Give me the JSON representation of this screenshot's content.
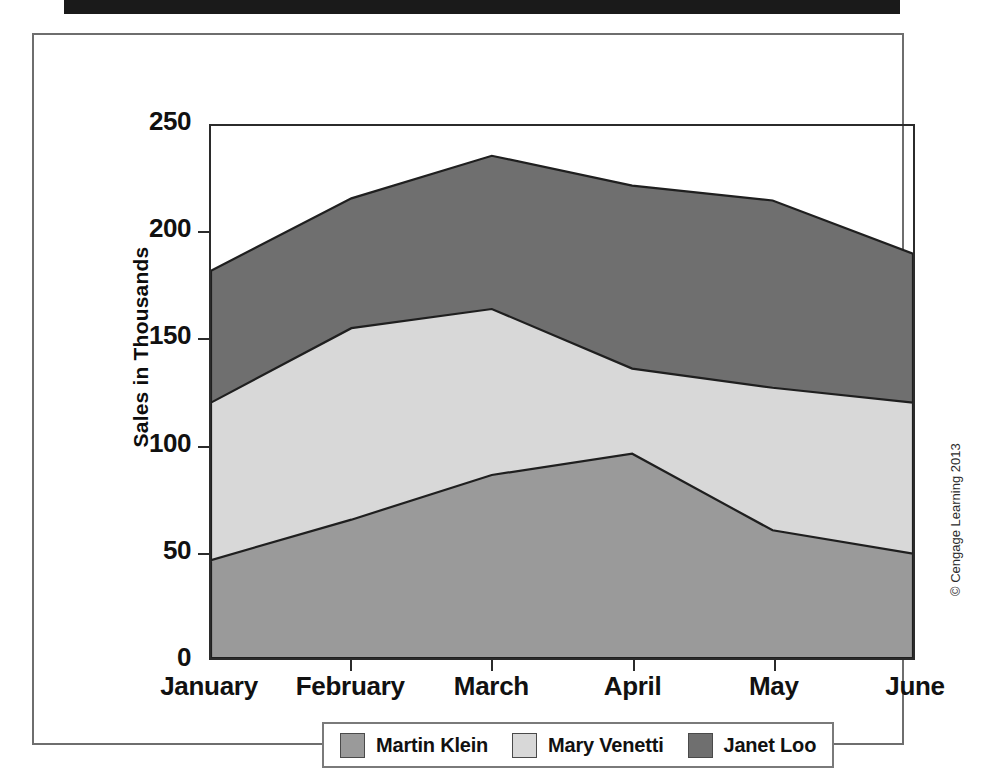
{
  "chart_data": {
    "type": "area",
    "stacked": true,
    "title": "",
    "subtitle": "",
    "xlabel": "",
    "ylabel": "Sales in Thousands",
    "categories": [
      "January",
      "February",
      "March",
      "April",
      "May",
      "June"
    ],
    "ylim": [
      0,
      250
    ],
    "yticks": [
      0,
      50,
      100,
      150,
      200,
      250
    ],
    "ytick_labels": [
      "0",
      "50",
      "100",
      "150",
      "200",
      "250"
    ],
    "grid": false,
    "legend_position": "bottom",
    "series": [
      {
        "name": "Martin Klein",
        "color": "#9a9a9a",
        "values": [
          46,
          65,
          86,
          96,
          60,
          49
        ],
        "cumulative": [
          46,
          65,
          86,
          96,
          60,
          49
        ]
      },
      {
        "name": "Mary Venetti",
        "color": "#d8d8d8",
        "values": [
          74,
          90,
          78,
          40,
          67,
          71
        ],
        "cumulative": [
          120,
          155,
          164,
          136,
          127,
          120
        ]
      },
      {
        "name": "Janet Loo",
        "color": "#6f6f6f",
        "values": [
          62,
          61,
          72,
          86,
          88,
          70
        ],
        "cumulative": [
          182,
          216,
          236,
          222,
          215,
          190
        ]
      }
    ]
  },
  "legend": {
    "items": [
      {
        "label": "Martin Klein",
        "color": "#9a9a9a"
      },
      {
        "label": "Mary Venetti",
        "color": "#d8d8d8"
      },
      {
        "label": "Janet Loo",
        "color": "#6f6f6f"
      }
    ]
  },
  "axis": {
    "y_title": "Sales in Thousands"
  },
  "footer": {
    "copyright": "© Cengage Learning 2013"
  }
}
